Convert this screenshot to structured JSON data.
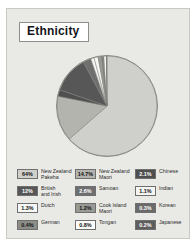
{
  "panel": {
    "title": "Ethnicity",
    "background_color": "#e9e9e6",
    "border_color": "#c9c9c4"
  },
  "chart_data": {
    "type": "pie",
    "title": "Ethnicity",
    "xlabel": "",
    "ylabel": "",
    "legend_position": "bottom",
    "grid": false,
    "unit": "%",
    "categories": [
      "New Zealand\nPakeha",
      "New Zealand\nMaori",
      "Chinese",
      "British\nand Irish",
      "Samoan",
      "Indian",
      "Dutch",
      "Cook Island\nMaori",
      "Korean",
      "German",
      "Tongan",
      "Japanese"
    ],
    "values": [
      64,
      14.7,
      2.1,
      12,
      2.6,
      1.1,
      1.3,
      1.2,
      0.3,
      0.4,
      0.8,
      0.2
    ],
    "slices": [
      {
        "label": "New Zealand\nPakeha",
        "value": 64,
        "display": "64%",
        "color": "#cfcfcb",
        "text_color": "#111111"
      },
      {
        "label": "New Zealand\nMaori",
        "value": 14.7,
        "display": "14.7%",
        "color": "#b4b4ae",
        "text_color": "#111111"
      },
      {
        "label": "Chinese",
        "value": 2.1,
        "display": "2.1%",
        "color": "#4f4f4f",
        "text_color": "#ffffff"
      },
      {
        "label": "British\nand Irish",
        "value": 12,
        "display": "12%",
        "color": "#575757",
        "text_color": "#ffffff"
      },
      {
        "label": "Samoan",
        "value": 2.6,
        "display": "2.6%",
        "color": "#6f6f6f",
        "text_color": "#ffffff"
      },
      {
        "label": "Indian",
        "value": 1.1,
        "display": "1.1%",
        "color": "#f4f4f2",
        "text_color": "#111111"
      },
      {
        "label": "Dutch",
        "value": 1.3,
        "display": "1.3%",
        "color": "#f7f7f5",
        "text_color": "#111111"
      },
      {
        "label": "Cook Island\nMaori",
        "value": 1.2,
        "display": "1.2%",
        "color": "#9a9a95",
        "text_color": "#111111"
      },
      {
        "label": "Korean",
        "value": 0.3,
        "display": "0.3%",
        "color": "#6a6a6a",
        "text_color": "#ffffff"
      },
      {
        "label": "German",
        "value": 0.4,
        "display": "0.4%",
        "color": "#8d8d88",
        "text_color": "#111111"
      },
      {
        "label": "Tongan",
        "value": 0.8,
        "display": "0.8%",
        "color": "#fbfbf9",
        "text_color": "#111111"
      },
      {
        "label": "Japanese",
        "value": 0.2,
        "display": "0.2%",
        "color": "#5e5e5e",
        "text_color": "#ffffff"
      }
    ]
  },
  "legend": {
    "columns": [
      {
        "entries": [
          {
            "display": "64%",
            "label": "New Zealand\nPakeha",
            "color": "#cfcfcb",
            "text_color": "#111111"
          },
          {
            "display": "12%",
            "label": "British\nand Irish",
            "color": "#575757",
            "text_color": "#ffffff"
          },
          {
            "display": "1.3%",
            "label": "Dutch",
            "color": "#f7f7f5",
            "text_color": "#111111"
          },
          {
            "display": "0.4%",
            "label": "German",
            "color": "#8d8d88",
            "text_color": "#111111"
          }
        ]
      },
      {
        "entries": [
          {
            "display": "14.7%",
            "label": "New Zealand\nMaori",
            "color": "#b4b4ae",
            "text_color": "#111111"
          },
          {
            "display": "2.6%",
            "label": "Samoan",
            "color": "#6f6f6f",
            "text_color": "#ffffff"
          },
          {
            "display": "1.2%",
            "label": "Cook Island\nMaori",
            "color": "#9a9a95",
            "text_color": "#111111"
          },
          {
            "display": "0.8%",
            "label": "Tongan",
            "color": "#fbfbf9",
            "text_color": "#111111"
          }
        ]
      },
      {
        "entries": [
          {
            "display": "2.1%",
            "label": "Chinese",
            "color": "#4f4f4f",
            "text_color": "#ffffff"
          },
          {
            "display": "1.1%",
            "label": "Indian",
            "color": "#f4f4f2",
            "text_color": "#111111"
          },
          {
            "display": "0.3%",
            "label": "Korean",
            "color": "#6a6a6a",
            "text_color": "#ffffff"
          },
          {
            "display": "0.2%",
            "label": "Japanese",
            "color": "#5e5e5e",
            "text_color": "#ffffff"
          }
        ]
      }
    ]
  }
}
